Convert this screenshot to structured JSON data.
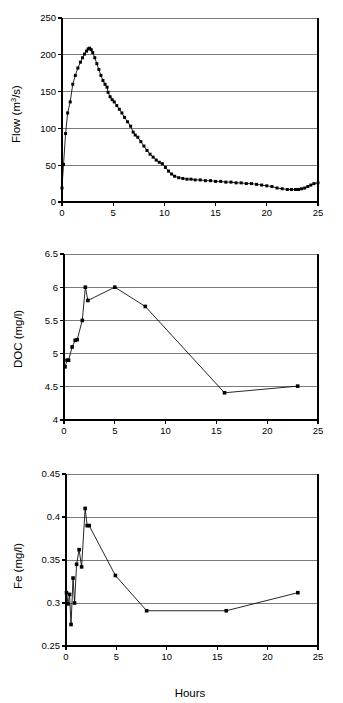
{
  "figure": {
    "x_axis_label": "Hours",
    "panels": [
      "flow",
      "doc",
      "fe"
    ]
  },
  "chart_data": [
    {
      "type": "scatter",
      "id": "flow",
      "title": "",
      "xlabel": "",
      "ylabel": "Flow (m3/s)",
      "ylabel_display": "Flow (m³/s)",
      "xlim": [
        0,
        25
      ],
      "ylim": [
        0,
        250
      ],
      "xticks": [
        0,
        5,
        10,
        15,
        20,
        25
      ],
      "yticks": [
        0,
        50,
        100,
        150,
        200,
        250
      ],
      "xtick_labels": [
        "0",
        "5",
        "10",
        "15",
        "20",
        "25"
      ],
      "ytick_labels": [
        "0",
        "50",
        "100",
        "150",
        "200",
        "250"
      ],
      "grid": "horizontal",
      "legend": "none",
      "marker": "filled-square",
      "x": [
        0.0,
        0.15,
        0.35,
        0.55,
        0.8,
        1.05,
        1.3,
        1.55,
        1.8,
        2.0,
        2.2,
        2.4,
        2.55,
        2.7,
        2.85,
        3.0,
        3.2,
        3.4,
        3.6,
        3.8,
        4.0,
        4.2,
        4.4,
        4.5,
        4.7,
        4.9,
        5.1,
        5.35,
        5.6,
        5.85,
        6.1,
        6.4,
        6.7,
        6.95,
        7.15,
        7.4,
        7.7,
        8.0,
        8.3,
        8.6,
        8.9,
        9.2,
        9.5,
        9.8,
        10.1,
        10.4,
        10.7,
        11.0,
        11.4,
        11.8,
        12.2,
        12.6,
        13.0,
        13.5,
        14.0,
        14.5,
        15.0,
        15.5,
        16.0,
        16.5,
        17.0,
        17.5,
        18.0,
        18.5,
        19.0,
        19.5,
        20.0,
        20.5,
        21.0,
        21.5,
        22.0,
        22.4,
        22.8,
        23.1,
        23.4,
        23.7,
        24.0,
        24.3,
        24.6,
        25.0
      ],
      "values": [
        19,
        51,
        93,
        121,
        136,
        160,
        172,
        182,
        190,
        196,
        201,
        205,
        208,
        209,
        207,
        203,
        196,
        188,
        180,
        172,
        165,
        160,
        156,
        149,
        143,
        139,
        136,
        131,
        126,
        121,
        115,
        109,
        103,
        95,
        91,
        88,
        82,
        76,
        70,
        65,
        61,
        57,
        54,
        52,
        47,
        42,
        38,
        35,
        33,
        32,
        31,
        31,
        30,
        30,
        29,
        29,
        28,
        28,
        27,
        27,
        26,
        26,
        25,
        25,
        24,
        23,
        22,
        21,
        19,
        18,
        17,
        17,
        17,
        17,
        18,
        19,
        21,
        23,
        25,
        26
      ]
    },
    {
      "type": "line",
      "id": "doc",
      "title": "",
      "xlabel": "",
      "ylabel": "DOC (mg/l)",
      "ylabel_display": "DOC (mg/l)",
      "xlim": [
        0,
        25
      ],
      "ylim": [
        4,
        6.5
      ],
      "xticks": [
        0,
        5,
        10,
        15,
        20,
        25
      ],
      "yticks": [
        4,
        4.5,
        5,
        5.5,
        6,
        6.5
      ],
      "xtick_labels": [
        "0",
        "5",
        "10",
        "15",
        "20",
        "25"
      ],
      "ytick_labels": [
        "4",
        "4.5",
        "5",
        "5.5",
        "6",
        "6.5"
      ],
      "grid": "horizontal",
      "legend": "none",
      "marker": "filled-square",
      "x": [
        0.1,
        0.3,
        0.45,
        0.8,
        1.1,
        1.3,
        1.8,
        2.1,
        2.35,
        5.0,
        8.0,
        15.8,
        23.0
      ],
      "values": [
        4.8,
        4.9,
        4.9,
        5.1,
        5.2,
        5.21,
        5.5,
        6.0,
        5.8,
        6.0,
        5.71,
        4.41,
        4.51
      ]
    },
    {
      "type": "line",
      "id": "fe",
      "title": "",
      "xlabel": "Hours",
      "ylabel": "Fe (mg/l)",
      "ylabel_display": "Fe (mg/l)",
      "xlim": [
        0,
        25
      ],
      "ylim": [
        0.25,
        0.45
      ],
      "xticks": [
        0,
        5,
        10,
        15,
        20,
        25
      ],
      "yticks": [
        0.25,
        0.3,
        0.35,
        0.4,
        0.45
      ],
      "xtick_labels": [
        "0",
        "5",
        "10",
        "15",
        "20",
        "25"
      ],
      "ytick_labels": [
        "0.25",
        "0.3",
        "0.35",
        "0.4",
        "0.45"
      ],
      "grid": "horizontal",
      "legend": "none",
      "marker": "filled-square",
      "x": [
        0.05,
        0.2,
        0.35,
        0.5,
        0.7,
        0.85,
        1.05,
        1.3,
        1.55,
        1.9,
        2.1,
        2.3,
        4.9,
        8.0,
        15.9,
        23.0
      ],
      "values": [
        0.312,
        0.299,
        0.31,
        0.275,
        0.329,
        0.3,
        0.345,
        0.362,
        0.342,
        0.41,
        0.39,
        0.39,
        0.332,
        0.291,
        0.291,
        0.312
      ]
    }
  ]
}
